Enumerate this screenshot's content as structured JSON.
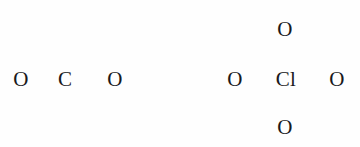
{
  "figure": {
    "width": 360,
    "height": 147,
    "background_color": "#fefefe",
    "glyph_color": "#19191c",
    "font_size_px": 21,
    "font_style": "serif"
  },
  "molecules": [
    {
      "name": "carbon-dioxide-skeleton",
      "formula": "O C O",
      "layout": "linear-horizontal",
      "atoms": [
        {
          "symbol": "O",
          "x": 21,
          "y": 79,
          "position": "left"
        },
        {
          "symbol": "C",
          "x": 65,
          "y": 79,
          "position": "center"
        },
        {
          "symbol": "O",
          "x": 115,
          "y": 79,
          "position": "right"
        }
      ]
    },
    {
      "name": "perchlorate-skeleton",
      "formula": "O Cl O with O above and O below",
      "layout": "cross-tetrahedral",
      "atoms": [
        {
          "symbol": "O",
          "x": 285,
          "y": 29,
          "position": "top"
        },
        {
          "symbol": "O",
          "x": 235,
          "y": 79,
          "position": "left"
        },
        {
          "symbol": "Cl",
          "x": 286,
          "y": 79,
          "position": "center"
        },
        {
          "symbol": "O",
          "x": 337,
          "y": 79,
          "position": "right"
        },
        {
          "symbol": "O",
          "x": 285,
          "y": 127,
          "position": "bottom"
        }
      ]
    }
  ]
}
